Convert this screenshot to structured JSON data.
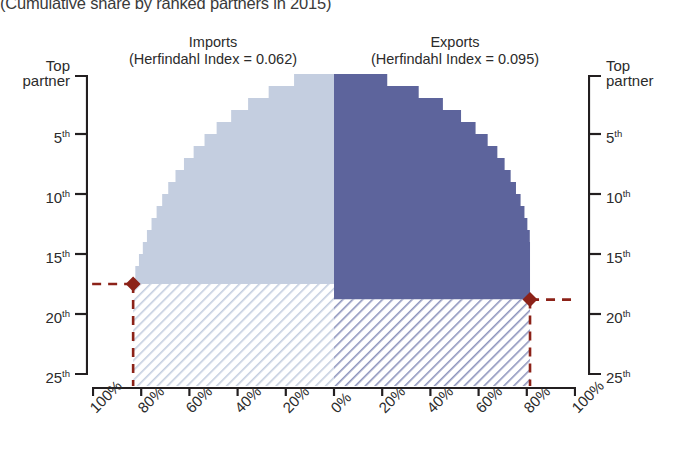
{
  "title": "(Cumulative share by ranked partners in 2015)",
  "panels": {
    "imports": {
      "name": "Imports",
      "index_label": "(Herfindahl Index = 0.062)",
      "index_value": 0.062,
      "color": "#c4cee0"
    },
    "exports": {
      "name": "Exports",
      "index_label": "(Herfindahl Index = 0.095)",
      "index_value": 0.095,
      "color": "#5d649c"
    }
  },
  "axes": {
    "left_ticks": [
      "Top partner",
      "5",
      "10",
      "15",
      "20",
      "25"
    ],
    "right_ticks": [
      "Top partner",
      "5",
      "10",
      "15",
      "20",
      "25"
    ],
    "ordinal_suffix": "th",
    "x_ticks_left": [
      "100%",
      "80%",
      "60%",
      "40%",
      "20%",
      "0%"
    ],
    "x_ticks_right": [
      "20%",
      "40%",
      "60%",
      "80%",
      "100%"
    ]
  },
  "markers": {
    "color": "#8c2218",
    "imports": {
      "rank": 17.5,
      "share": 83,
      "label": "imports-threshold-marker"
    },
    "exports": {
      "rank": 18.8,
      "share": 81,
      "label": "exports-threshold-marker"
    }
  },
  "chart_data": {
    "type": "area",
    "title": "(Cumulative share by ranked partners in 2015)",
    "xlabel": "",
    "ylabel": "Partner rank",
    "orientation": "back-to-back horizontal step (tornado)",
    "grid": false,
    "legend": "none",
    "ylim": [
      0,
      26
    ],
    "y_direction": "top partner at top, rank increases downward",
    "xlim_left": [
      0,
      100
    ],
    "xlim_right": [
      0,
      100
    ],
    "ranks": [
      1,
      2,
      3,
      4,
      5,
      6,
      7,
      8,
      9,
      10,
      11,
      12,
      13,
      14,
      15,
      16,
      17,
      18,
      19,
      20,
      21,
      22,
      23,
      24,
      25,
      26
    ],
    "series": [
      {
        "name": "Imports",
        "side": "left",
        "units": "% cumulative share",
        "color": "#c4cee0",
        "values": [
          16.5,
          27.0,
          35.5,
          42.5,
          48.5,
          53.5,
          58.0,
          62.0,
          65.5,
          68.5,
          71.0,
          73.3,
          75.4,
          77.3,
          79.0,
          80.6,
          82.1,
          83.0,
          83.0,
          83.0,
          83.0,
          83.0,
          83.0,
          83.0,
          83.0,
          83.0
        ]
      },
      {
        "name": "Exports",
        "side": "right",
        "units": "% cumulative share",
        "color": "#5d649c",
        "values": [
          22.0,
          35.0,
          45.0,
          52.5,
          58.5,
          63.5,
          67.5,
          70.5,
          73.0,
          75.2,
          77.1,
          78.7,
          79.9,
          80.9,
          81.0,
          81.0,
          81.0,
          81.0,
          81.0,
          81.0,
          81.0,
          81.0,
          81.0,
          81.0,
          81.0,
          81.0
        ]
      }
    ],
    "annotations": [
      {
        "name": "imports-threshold",
        "series": "Imports",
        "rank": 17.5,
        "share": 83,
        "style": "dark-red dashed line with diamond marker"
      },
      {
        "name": "exports-threshold",
        "series": "Exports",
        "rank": 18.8,
        "share": 81,
        "style": "dark-red dashed line with diamond marker"
      }
    ]
  }
}
